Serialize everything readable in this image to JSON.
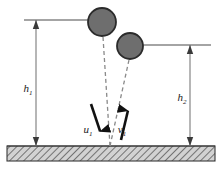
{
  "figure": {
    "type": "physics-diagram",
    "width": 223,
    "height": 169,
    "background_color": "#ffffff"
  },
  "labels": {
    "h1": {
      "base": "h",
      "sub": "1",
      "x": 28,
      "y": 92
    },
    "h2": {
      "base": "h",
      "sub": "2",
      "x": 182,
      "y": 101
    },
    "u1": {
      "base": "u",
      "sub": "1",
      "x": 88,
      "y": 133
    },
    "v1": {
      "base": "v",
      "sub": "1",
      "x": 122,
      "y": 133
    }
  },
  "balls": [
    {
      "name": "ball-before-impact",
      "cx": 102,
      "cy": 22,
      "r": 14,
      "fill": "#6e6e6e",
      "stroke": "#2b2b2b"
    },
    {
      "name": "ball-after-impact",
      "cx": 130,
      "cy": 46,
      "r": 13,
      "fill": "#6e6e6e",
      "stroke": "#2b2b2b"
    }
  ],
  "reference_lines": [
    {
      "name": "drop-height-reference-line",
      "x1": 24,
      "y1": 20,
      "x2": 90,
      "y2": 20
    },
    {
      "name": "rebound-height-reference-line",
      "x1": 143,
      "y1": 45,
      "x2": 211,
      "y2": 45
    }
  ],
  "dimension_arrows": [
    {
      "name": "h1-dimension-arrow",
      "x": 36,
      "y_top": 20,
      "y_bottom": 146
    },
    {
      "name": "h2-dimension-arrow",
      "x": 190,
      "y_top": 45,
      "y_bottom": 146
    }
  ],
  "trajectories": [
    {
      "name": "incoming-trajectory-dashed",
      "x1": 103,
      "y1": 37,
      "x2": 110,
      "y2": 146
    },
    {
      "name": "outgoing-trajectory-dashed",
      "x1": 110,
      "y1": 146,
      "x2": 129,
      "y2": 60
    }
  ],
  "velocity_arrows": [
    {
      "name": "u1-velocity-arrow",
      "direction": "down",
      "x1": 91,
      "y1": 104,
      "x2": 103,
      "y2": 140
    },
    {
      "name": "v1-velocity-arrow",
      "direction": "up",
      "x1": 121,
      "y1": 140,
      "x2": 130,
      "y2": 102
    }
  ],
  "ground": {
    "name": "ground-surface",
    "x": 7,
    "y": 146,
    "width": 208,
    "height": 15,
    "fill": "#d2d2d2",
    "stroke": "#3a3a3a",
    "hatch_color": "#5a5a5a"
  },
  "colors": {
    "line": "#4a4a4a",
    "dark_line": "#111111",
    "ball_fill": "#6e6e6e",
    "ball_stroke": "#2b2b2b",
    "ground_fill": "#d2d2d2",
    "text": "#1a1a1a"
  }
}
